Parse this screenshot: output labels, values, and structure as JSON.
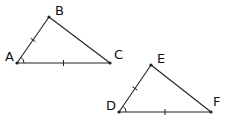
{
  "diagram": {
    "type": "congruent-triangles-sas",
    "triangles": [
      {
        "name": "ABC",
        "vertices": [
          {
            "label": "A",
            "angle_marked": true
          },
          {
            "label": "B",
            "angle_marked": false
          },
          {
            "label": "C",
            "angle_marked": false
          }
        ],
        "edges": [
          {
            "from": "A",
            "to": "B",
            "tick_marks": 1
          },
          {
            "from": "B",
            "to": "C",
            "tick_marks": 0
          },
          {
            "from": "A",
            "to": "C",
            "tick_marks": 1
          }
        ]
      },
      {
        "name": "DEF",
        "vertices": [
          {
            "label": "D",
            "angle_marked": true
          },
          {
            "label": "E",
            "angle_marked": false
          },
          {
            "label": "F",
            "angle_marked": false
          }
        ],
        "edges": [
          {
            "from": "D",
            "to": "E",
            "tick_marks": 1
          },
          {
            "from": "E",
            "to": "F",
            "tick_marks": 0
          },
          {
            "from": "D",
            "to": "F",
            "tick_marks": 1
          }
        ]
      }
    ]
  }
}
